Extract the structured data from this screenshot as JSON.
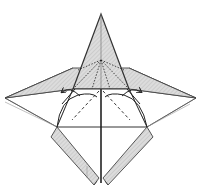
{
  "diagram": {
    "type": "origami-fold-step",
    "colors": {
      "paper_shaded": "#d9d9d9",
      "paper_white": "#ffffff",
      "line": "#333333",
      "thin_line": "#777777"
    },
    "elements": {
      "top_flap": "pointed triangular flap, shaded",
      "left_wing": "shaded wing extending left",
      "right_wing": "shaded wing extending right",
      "lower_body": "white square body with center slit",
      "left_lower_flap": "hatched diagonal strip",
      "right_lower_flap": "hatched diagonal strip",
      "valley_folds": "dashed diagonal lines",
      "fold_arrows": "two curved arrows pointing outward"
    }
  }
}
